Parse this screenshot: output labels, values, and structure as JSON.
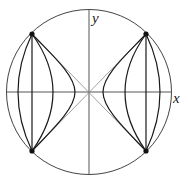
{
  "diagram": {
    "axes": {
      "x_label": "x",
      "y_label": "y"
    },
    "center": [
      89,
      92
    ],
    "radius": 82,
    "colors": {
      "stroke": "#1a1a1a",
      "asymptote": "#8a8a8a",
      "axis": "#555555",
      "circle": "#444444",
      "dot": "#111111"
    },
    "points": [
      {
        "name": "top-left",
        "x": 32,
        "y": 34
      },
      {
        "name": "top-right",
        "x": 146,
        "y": 34
      },
      {
        "name": "bottom-left",
        "x": 32,
        "y": 151
      },
      {
        "name": "bottom-right",
        "x": 146,
        "y": 151
      }
    ],
    "left_family_midpoints_x": [
      18,
      32,
      53,
      75
    ],
    "right_family_midpoints_x": [
      103,
      125,
      146,
      160
    ]
  }
}
